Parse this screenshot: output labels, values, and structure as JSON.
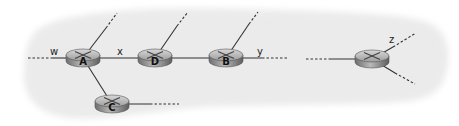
{
  "diagram": {
    "type": "network-topology",
    "background_color": "#ebebeb",
    "link_color": "#333333",
    "router_color": "#8e8e8e",
    "routers": [
      {
        "id": "A",
        "label": "A",
        "cx": 83,
        "cy": 58
      },
      {
        "id": "D",
        "label": "D",
        "cx": 155,
        "cy": 58
      },
      {
        "id": "B",
        "label": "B",
        "cx": 226,
        "cy": 58
      },
      {
        "id": "C",
        "label": "C",
        "cx": 112,
        "cy": 104
      },
      {
        "id": "R5",
        "label": "",
        "cx": 372,
        "cy": 59
      }
    ],
    "link_labels": {
      "w": "w",
      "x": "x",
      "y": "y",
      "z": "z"
    },
    "links": [
      {
        "from": "A",
        "to": "D",
        "label": "x"
      },
      {
        "from": "D",
        "to": "B"
      },
      {
        "from": "A",
        "to": "C"
      }
    ],
    "dangling_links": [
      {
        "router": "A",
        "direction": "west",
        "label": "w"
      },
      {
        "router": "A",
        "direction": "north-east"
      },
      {
        "router": "D",
        "direction": "north-east"
      },
      {
        "router": "B",
        "direction": "north-east"
      },
      {
        "router": "B",
        "direction": "east",
        "label": "y"
      },
      {
        "router": "C",
        "direction": "east"
      },
      {
        "router": "R5",
        "direction": "west"
      },
      {
        "router": "R5",
        "direction": "north-east",
        "label": "z"
      },
      {
        "router": "R5",
        "direction": "south-east"
      }
    ]
  }
}
